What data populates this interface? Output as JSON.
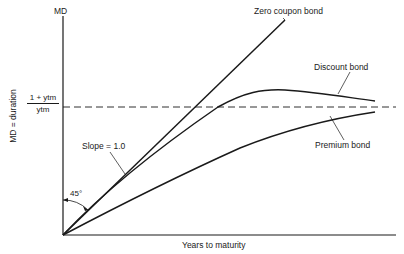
{
  "figure": {
    "y_axis_top_label": "MD",
    "y_axis_label": "MD = duration",
    "x_axis_label": "Years to maturity",
    "asymptote": {
      "numerator": "1 + ytm",
      "denominator": "ytm",
      "style": "dashed"
    },
    "curves": [
      {
        "name": "zero-coupon",
        "label": "Zero coupon bond"
      },
      {
        "name": "discount",
        "label": "Discount bond"
      },
      {
        "name": "premium",
        "label": "Premium bond"
      }
    ],
    "annotations": {
      "slope": "Slope = 1.0",
      "angle": "45°"
    },
    "colors": {
      "ink": "#1a1a1a",
      "background": "#ffffff"
    }
  }
}
